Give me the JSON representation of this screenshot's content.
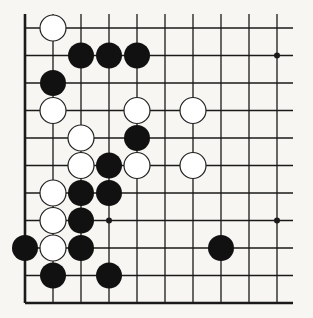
{
  "diagram": {
    "type": "go-board-fragment",
    "colors": {
      "background": "#f7f6f2",
      "line": "#1a1a1a",
      "black_stone": "#111111",
      "white_stone": "#ffffff"
    },
    "grid": {
      "columns": 10,
      "rows": 11,
      "origin_x": 25,
      "origin_y": 28,
      "spacing_x": 28,
      "spacing_y": 27.5,
      "right_extent": 293,
      "top_extent": 14,
      "edges": [
        "left",
        "bottom"
      ]
    },
    "hoshi": [
      {
        "col": 9,
        "row": 1
      },
      {
        "col": 3,
        "row": 7
      },
      {
        "col": 9,
        "row": 7
      }
    ],
    "stones": [
      {
        "color": "white",
        "col": 1,
        "row": 0
      },
      {
        "color": "black",
        "col": 2,
        "row": 1
      },
      {
        "color": "black",
        "col": 3,
        "row": 1
      },
      {
        "color": "black",
        "col": 4,
        "row": 1
      },
      {
        "color": "black",
        "col": 1,
        "row": 2
      },
      {
        "color": "white",
        "col": 1,
        "row": 3
      },
      {
        "color": "white",
        "col": 4,
        "row": 3
      },
      {
        "color": "white",
        "col": 6,
        "row": 3
      },
      {
        "color": "white",
        "col": 2,
        "row": 4
      },
      {
        "color": "black",
        "col": 4,
        "row": 4
      },
      {
        "color": "white",
        "col": 2,
        "row": 5
      },
      {
        "color": "black",
        "col": 3,
        "row": 5
      },
      {
        "color": "white",
        "col": 4,
        "row": 5
      },
      {
        "color": "white",
        "col": 6,
        "row": 5
      },
      {
        "color": "white",
        "col": 1,
        "row": 6
      },
      {
        "color": "black",
        "col": 2,
        "row": 6
      },
      {
        "color": "black",
        "col": 3,
        "row": 6
      },
      {
        "color": "white",
        "col": 1,
        "row": 7
      },
      {
        "color": "black",
        "col": 2,
        "row": 7
      },
      {
        "color": "black",
        "col": 0,
        "row": 8
      },
      {
        "color": "white",
        "col": 1,
        "row": 8
      },
      {
        "color": "black",
        "col": 2,
        "row": 8
      },
      {
        "color": "black",
        "col": 7,
        "row": 8
      },
      {
        "color": "black",
        "col": 1,
        "row": 9
      },
      {
        "color": "black",
        "col": 3,
        "row": 9
      }
    ]
  }
}
